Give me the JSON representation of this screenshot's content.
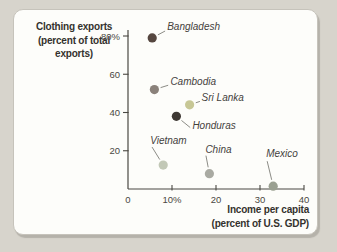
{
  "colors": {
    "page_bg": "#d7d4cc",
    "panel_bg": "#fdfdfa",
    "panel_border": "#c6c3bb",
    "axis": "#4a4842",
    "leader_line": "#8c8c86",
    "country_label": "#44413c",
    "axis_title": "#34322e"
  },
  "chart_data": {
    "type": "scatter",
    "title": "",
    "ylabel": "Clothing exports (percent of total exports)",
    "ylabel_lines": [
      "Clothing exports",
      "(percent of total",
      "exports)"
    ],
    "xlabel": "Income per capita (percent of U.S. GDP)",
    "xlabel_lines": [
      "Income per capita",
      "(percent of U.S. GDP)"
    ],
    "xlim": [
      0,
      40
    ],
    "ylim": [
      0,
      80
    ],
    "grid": false,
    "x_ticks": [
      {
        "value": 0,
        "label": "0"
      },
      {
        "value": 10,
        "label": "10%"
      },
      {
        "value": 20,
        "label": "20"
      },
      {
        "value": 30,
        "label": "30"
      },
      {
        "value": 40,
        "label": "40"
      }
    ],
    "y_ticks": [
      {
        "value": 20,
        "label": "20"
      },
      {
        "value": 40,
        "label": "40"
      },
      {
        "value": 60,
        "label": "60"
      },
      {
        "value": 80,
        "label": "80%"
      }
    ],
    "points": [
      {
        "name": "Bangladesh",
        "x": 5.5,
        "y": 79,
        "color": "#55463f",
        "label_offset": [
          15,
          -8
        ]
      },
      {
        "name": "Cambodia",
        "x": 6,
        "y": 52,
        "color": "#8a817a",
        "label_offset": [
          16,
          -5
        ]
      },
      {
        "name": "Sri Lanka",
        "x": 14,
        "y": 44,
        "color": "#c7c795",
        "label_offset": [
          12,
          -4
        ]
      },
      {
        "name": "Honduras",
        "x": 11,
        "y": 38,
        "color": "#3e3833",
        "label_offset": [
          16,
          13
        ]
      },
      {
        "name": "Vietnam",
        "x": 8,
        "y": 12.5,
        "color": "#c2c8b6",
        "label_offset": [
          -13,
          -21
        ]
      },
      {
        "name": "China",
        "x": 18.5,
        "y": 8,
        "color": "#a9aaa2",
        "label_offset": [
          -4,
          -21
        ]
      },
      {
        "name": "Mexico",
        "x": 33,
        "y": 1.5,
        "color": "#9aa091",
        "label_offset": [
          -7,
          -29
        ]
      }
    ]
  }
}
